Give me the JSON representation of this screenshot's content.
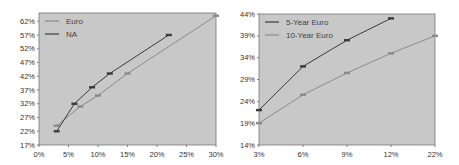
{
  "chart_data": [
    {
      "type": "line",
      "title": "",
      "xlabel": "",
      "ylabel": "",
      "x_ticks": [
        "0%",
        "5%",
        "10%",
        "15%",
        "20%",
        "25%",
        "30%"
      ],
      "y_ticks": [
        "17%",
        "22%",
        "27%",
        "32%",
        "37%",
        "42%",
        "47%",
        "52%",
        "57%",
        "62%"
      ],
      "xlim": [
        0,
        30
      ],
      "ylim": [
        17,
        65
      ],
      "grid": false,
      "legend_position": "upper-left",
      "background": "#c8c8c8",
      "series": [
        {
          "name": "Euro",
          "color": "#8a8a8a",
          "x": [
            3,
            7,
            10,
            15,
            30
          ],
          "y": [
            24,
            31,
            35,
            43,
            64
          ]
        },
        {
          "name": "NA",
          "color": "#3a3a3a",
          "x": [
            3,
            6,
            9,
            12,
            22
          ],
          "y": [
            22,
            32,
            38,
            43,
            57
          ]
        }
      ]
    },
    {
      "type": "line",
      "title": "",
      "xlabel": "",
      "ylabel": "",
      "categories": [
        "3%",
        "6%",
        "9%",
        "12%",
        "22%"
      ],
      "y_ticks": [
        "14%",
        "19%",
        "24%",
        "29%",
        "34%",
        "39%",
        "44%"
      ],
      "ylim": [
        14,
        44
      ],
      "grid": false,
      "legend_position": "upper-left",
      "background": "#c8c8c8",
      "series": [
        {
          "name": "5-Year Euro",
          "color": "#3a3a3a",
          "values": [
            22,
            32,
            38,
            43
          ]
        },
        {
          "name": "10-Year Euro",
          "color": "#8a8a8a",
          "values": [
            19,
            25.5,
            30.5,
            35,
            39
          ]
        }
      ]
    }
  ]
}
